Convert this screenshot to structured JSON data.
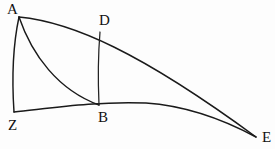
{
  "figure": {
    "background_color": "#fdfdfd",
    "stroke_color": "#1a1a1a",
    "vertices": [
      {
        "id": "A",
        "label": "A",
        "x": 19,
        "y": 17,
        "label_x": 7,
        "label_y": 2
      },
      {
        "id": "D",
        "label": "D",
        "x": 100,
        "y": 32,
        "label_x": 99,
        "label_y": 13
      },
      {
        "id": "B",
        "label": "B",
        "x": 99,
        "y": 105,
        "label_x": 98,
        "label_y": 110
      },
      {
        "id": "Z",
        "label": "Z",
        "x": 14,
        "y": 112,
        "label_x": 8,
        "label_y": 118
      },
      {
        "id": "E",
        "label": "E",
        "x": 256,
        "y": 137,
        "label_x": 262,
        "label_y": 130
      }
    ],
    "curves": [
      {
        "id": "arc-A-E",
        "name": "upper-arc-A-to-E",
        "from": "A",
        "to": "E",
        "description": "long upper arc from A through D curving down to E",
        "path": "M 19 17 C 72 22, 140 52, 256 137"
      },
      {
        "id": "arc-A-Z",
        "name": "left-arc-A-to-Z",
        "from": "A",
        "to": "Z",
        "description": "short left arc from A down to Z, bulging slightly left",
        "path": "M 19 17 C 13 45, 12 82, 14 112"
      },
      {
        "id": "arc-A-B",
        "name": "inner-arc-A-to-B",
        "from": "A",
        "to": "B",
        "description": "inner curve from A sweeping down-left then right to B",
        "path": "M 19 17 C 32 55, 58 90, 99 105"
      },
      {
        "id": "arc-Z-E",
        "name": "lower-arc-Z-to-E",
        "from": "Z",
        "to": "E",
        "description": "lower arc from Z through B rising slightly then down to E",
        "path": "M 14 112 C 52 108, 96 101, 146 103 C 190 106, 228 122, 256 137"
      },
      {
        "id": "seg-D-B",
        "name": "segment-D-to-B",
        "from": "D",
        "to": "B",
        "description": "near vertical segment joining D on the upper arc to B on the lower arc",
        "path": "M 100 32 C 98 56, 98 82, 99 105"
      }
    ]
  }
}
